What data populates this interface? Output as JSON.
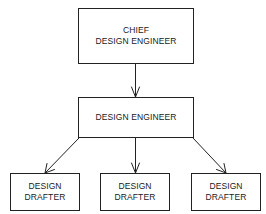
{
  "diagram": {
    "type": "org-chart",
    "nodes": {
      "chief": {
        "line1": "CHIEF",
        "line2": "DESIGN ENGINEER"
      },
      "engineer": {
        "line1": "DESIGN ENGINEER"
      },
      "drafters": [
        {
          "line1": "DESIGN",
          "line2": "DRAFTER"
        },
        {
          "line1": "DESIGN",
          "line2": "DRAFTER"
        },
        {
          "line1": "DESIGN",
          "line2": "DRAFTER"
        }
      ]
    },
    "edges": [
      {
        "from": "CHIEF DESIGN ENGINEER",
        "to": "DESIGN ENGINEER"
      },
      {
        "from": "DESIGN ENGINEER",
        "to": "DESIGN DRAFTER (left)"
      },
      {
        "from": "DESIGN ENGINEER",
        "to": "DESIGN DRAFTER (center)"
      },
      {
        "from": "DESIGN ENGINEER",
        "to": "DESIGN DRAFTER (right)"
      }
    ],
    "colors": {
      "line": "#222222",
      "background": "#ffffff"
    }
  }
}
